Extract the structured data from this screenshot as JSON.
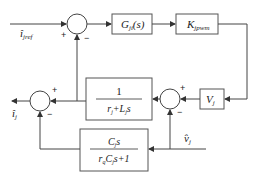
{
  "diagram": {
    "type": "control-block-diagram",
    "inputs": {
      "reference_current": "î",
      "reference_current_sub": "jref",
      "voltage_feedforward": "v̂",
      "voltage_feedforward_sub": "j"
    },
    "outputs": {
      "output_current": "î",
      "output_current_sub": "j"
    },
    "blocks": {
      "controller": {
        "main": "G",
        "sub": "ji",
        "tail": "(s)"
      },
      "pwm_gain": {
        "main": "K",
        "sub": "jpwm"
      },
      "voltage": {
        "main": "V",
        "sub": "j"
      },
      "inductor": {
        "numerator": "1",
        "den_r": "r",
        "den_r_sub": "j",
        "den_plus": "+",
        "den_L": "L",
        "den_L_sub": "j",
        "den_s": "s"
      },
      "capacitor": {
        "num_C": "C",
        "num_C_sub": "j",
        "num_s": "s",
        "den_r": "r",
        "den_r_sub": "q",
        "den_C": "C",
        "den_C_sub": "j",
        "den_s": "s",
        "den_tail": "+1"
      }
    },
    "signs": {
      "top_sum_plus": "+",
      "top_sum_minus": "−",
      "right_sum_plus": "+",
      "right_sum_minus": "−",
      "left_sum_plus": "+",
      "left_sum_minus": "−"
    }
  }
}
